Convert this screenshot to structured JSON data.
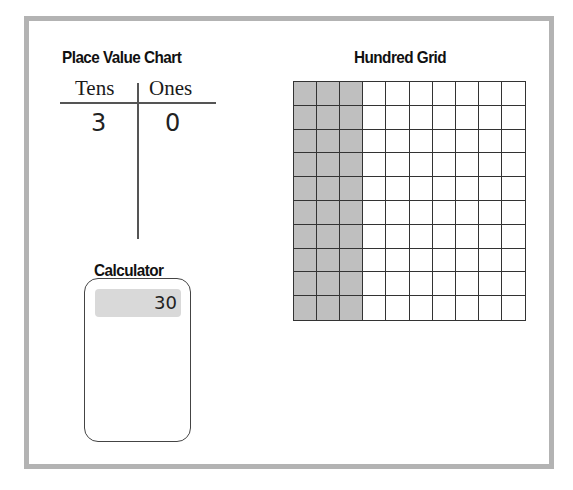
{
  "place_value_chart": {
    "title": "Place Value Chart",
    "columns": [
      "Tens",
      "Ones"
    ],
    "digits": [
      "3",
      "0"
    ]
  },
  "calculator": {
    "title": "Calculator",
    "display": "30"
  },
  "hundred_grid": {
    "title": "Hundred Grid",
    "rows": 10,
    "cols": 10,
    "shaded_columns": 3,
    "shaded_color": "#bfbfbf"
  },
  "colors": {
    "frame_border": "#b3b3b3",
    "grid_line": "#333333",
    "calculator_display": "#d9d9d9"
  }
}
